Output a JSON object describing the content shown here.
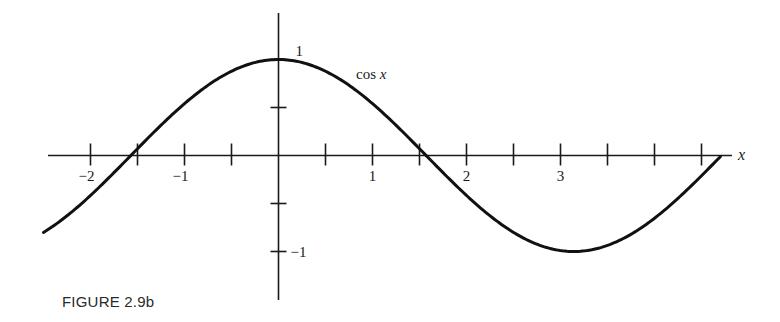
{
  "figure": {
    "caption": "FIGURE 2.9b"
  },
  "chart_data": {
    "type": "line",
    "title": "",
    "function": "cos x",
    "curve_label": "cos x",
    "xlabel": "x",
    "ylabel": "",
    "xlim": [
      -2.5,
      4.7
    ],
    "ylim": [
      -1.5,
      1.5
    ],
    "grid": false,
    "legend": "none (inline label 'cos x' near curve at x≈0.8)",
    "x_ticks": [
      -2,
      -1.5,
      -1,
      -0.5,
      0,
      0.5,
      1,
      1.5,
      2,
      2.5,
      3,
      3.5,
      4,
      4.5
    ],
    "x_tick_labels": [
      {
        "value": -2,
        "label": "−2"
      },
      {
        "value": -1,
        "label": "−1"
      },
      {
        "value": 1,
        "label": "1"
      },
      {
        "value": 2,
        "label": "2"
      },
      {
        "value": 3,
        "label": "3"
      }
    ],
    "y_ticks": [
      1,
      0.5,
      -0.5,
      -1
    ],
    "y_tick_labels": [
      {
        "value": 1,
        "label": "1"
      },
      {
        "value": -1,
        "label": "−1"
      }
    ],
    "x_range_plotted": [
      -2.5,
      4.7
    ],
    "series": [
      {
        "name": "cos x",
        "x": [
          -2.5,
          -2.0,
          -1.5708,
          -1.0,
          -0.5,
          0,
          0.5,
          1.0,
          1.5708,
          2.0,
          2.5,
          3.1416,
          3.5,
          4.0,
          4.5,
          4.7124
        ],
        "y": [
          -0.801,
          -0.416,
          0.0,
          0.54,
          0.878,
          1.0,
          0.878,
          0.54,
          0.0,
          -0.416,
          -0.801,
          -1.0,
          -0.936,
          -0.654,
          -0.211,
          0.0
        ]
      }
    ],
    "key_points": {
      "max": {
        "x": 0,
        "y": 1
      },
      "min": {
        "x": 3.1416,
        "y": -1
      },
      "zeros": [
        -1.5708,
        1.5708,
        4.7124
      ]
    }
  }
}
